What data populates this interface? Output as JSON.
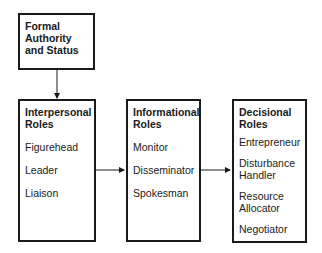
{
  "diagram": {
    "top_box": {
      "title": "Formal Authority and Status"
    },
    "boxes": [
      {
        "title": "Interpersonal Roles",
        "items": [
          "Figurehead",
          "Leader",
          "Liaison"
        ]
      },
      {
        "title": "Informational Roles",
        "items": [
          "Monitor",
          "Disseminator",
          "Spokesman"
        ]
      },
      {
        "title": "Decisional Roles",
        "items": [
          "Entrepreneur",
          "Disturbance Handler",
          "Resource Allocator",
          "Negotiator"
        ]
      }
    ],
    "arrows": [
      {
        "from": "Formal Authority and Status",
        "to": "Interpersonal Roles"
      },
      {
        "from": "Interpersonal Roles",
        "to": "Informational Roles"
      },
      {
        "from": "Informational Roles",
        "to": "Decisional Roles"
      }
    ]
  }
}
